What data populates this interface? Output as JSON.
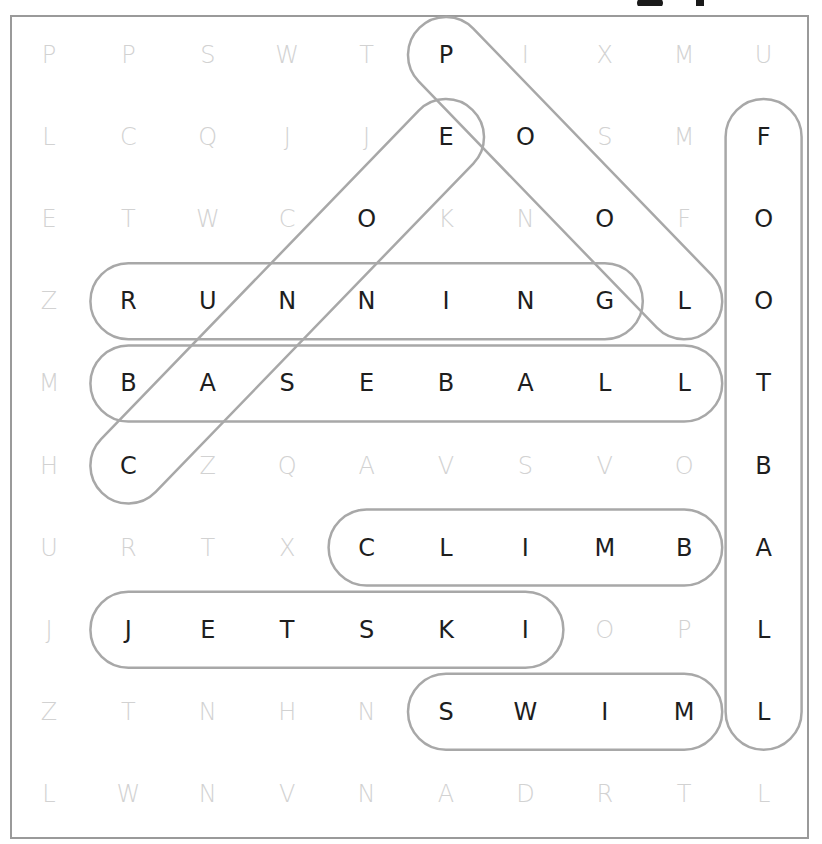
{
  "puzzle": {
    "grid": [
      [
        "P",
        "P",
        "S",
        "W",
        "T",
        "P",
        "I",
        "X",
        "M",
        "U"
      ],
      [
        "L",
        "C",
        "Q",
        "J",
        "J",
        "E",
        "O",
        "S",
        "M",
        "F"
      ],
      [
        "E",
        "T",
        "W",
        "C",
        "O",
        "K",
        "N",
        "O",
        "F",
        "O"
      ],
      [
        "Z",
        "R",
        "U",
        "N",
        "N",
        "I",
        "N",
        "G",
        "L",
        "O"
      ],
      [
        "M",
        "B",
        "A",
        "S",
        "E",
        "B",
        "A",
        "L",
        "L",
        "T"
      ],
      [
        "H",
        "C",
        "Z",
        "Q",
        "A",
        "V",
        "S",
        "V",
        "O",
        "B"
      ],
      [
        "U",
        "R",
        "T",
        "X",
        "C",
        "L",
        "I",
        "M",
        "B",
        "A"
      ],
      [
        "J",
        "J",
        "E",
        "T",
        "S",
        "K",
        "I",
        "O",
        "P",
        "L"
      ],
      [
        "Z",
        "T",
        "N",
        "H",
        "N",
        "S",
        "W",
        "I",
        "M",
        "L"
      ],
      [
        "L",
        "W",
        "N",
        "V",
        "N",
        "A",
        "D",
        "R",
        "T",
        "L"
      ]
    ],
    "found_words": [
      {
        "word": "POOL",
        "start": [
          0,
          5
        ],
        "end": [
          3,
          8
        ],
        "direction": "diagonal-down-right"
      },
      {
        "word": "CANOE",
        "start": [
          5,
          1
        ],
        "end": [
          1,
          5
        ],
        "direction": "diagonal-up-right"
      },
      {
        "word": "FOOTBALL",
        "start": [
          1,
          9
        ],
        "end": [
          8,
          9
        ],
        "direction": "vertical-down"
      },
      {
        "word": "RUNNING",
        "start": [
          3,
          1
        ],
        "end": [
          3,
          7
        ],
        "direction": "horizontal"
      },
      {
        "word": "BASEBALL",
        "start": [
          4,
          1
        ],
        "end": [
          4,
          8
        ],
        "direction": "horizontal"
      },
      {
        "word": "CLIMB",
        "start": [
          6,
          4
        ],
        "end": [
          6,
          8
        ],
        "direction": "horizontal"
      },
      {
        "word": "JETSKI",
        "start": [
          7,
          1
        ],
        "end": [
          7,
          6
        ],
        "direction": "horizontal"
      },
      {
        "word": "SWIM",
        "start": [
          8,
          5
        ],
        "end": [
          8,
          8
        ],
        "direction": "horizontal"
      }
    ]
  },
  "colors": {
    "found_letter": "#1e1e1e",
    "filler_letter": "#d2d2d2",
    "pill_outline": "#a8a8a8",
    "border": "#9a9a9a"
  }
}
